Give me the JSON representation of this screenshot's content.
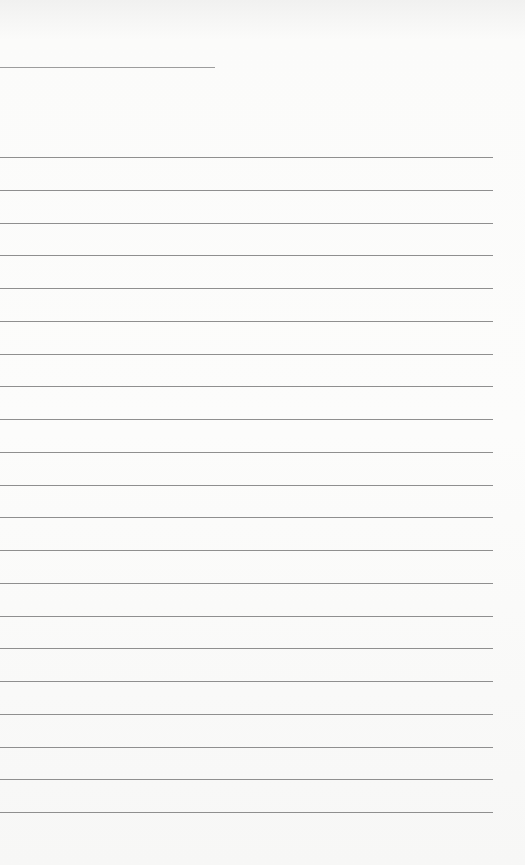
{
  "page": {
    "type": "lined-paper",
    "header_line": {
      "present": true
    },
    "ruled_lines": {
      "count": 21,
      "spacing_px": 32.75
    },
    "colors": {
      "paper": "#fbfbfa",
      "rule": "#8f8f8f"
    },
    "text": ""
  }
}
